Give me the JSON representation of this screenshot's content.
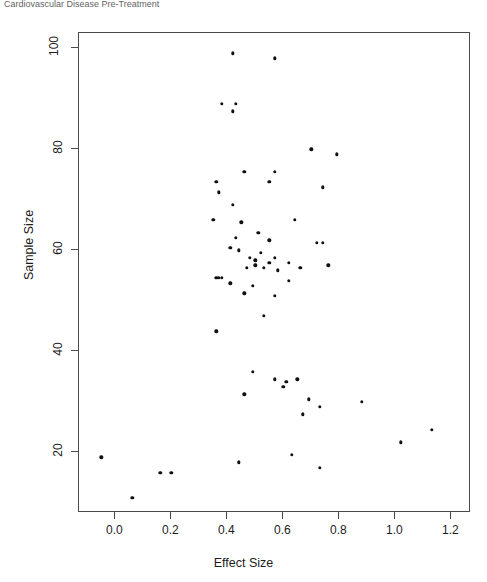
{
  "caption": {
    "text": "Cardiovascular Disease Pre-Treatment"
  },
  "chart_data": {
    "type": "scatter",
    "title": "",
    "xlabel": "Effect Size",
    "ylabel": "Sample Size",
    "xlim": [
      -0.13,
      1.27
    ],
    "ylim": [
      8,
      103
    ],
    "xticks": [
      0.0,
      0.2,
      0.4,
      0.6,
      0.8,
      1.0,
      1.2
    ],
    "xtick_labels": [
      "0.0",
      "0.2",
      "0.4",
      "0.6",
      "0.8",
      "1.0",
      "1.2"
    ],
    "yticks": [
      20,
      40,
      60,
      80,
      100
    ],
    "ytick_labels": [
      "20",
      "40",
      "60",
      "80",
      "100"
    ],
    "grid": false,
    "legend": false,
    "marker": "filled-circle",
    "marker_color": "#101010",
    "marker_size": 3.4,
    "series": [
      {
        "name": "studies",
        "points": [
          [
            0.42,
            99.0
          ],
          [
            0.57,
            98.0
          ],
          [
            0.38,
            89.0
          ],
          [
            0.43,
            89.0
          ],
          [
            0.42,
            87.5
          ],
          [
            0.7,
            80.0
          ],
          [
            0.79,
            79.0
          ],
          [
            0.46,
            75.5
          ],
          [
            0.57,
            75.5
          ],
          [
            0.36,
            73.5
          ],
          [
            0.74,
            72.5
          ],
          [
            0.55,
            73.5
          ],
          [
            0.37,
            71.5
          ],
          [
            0.42,
            69.0
          ],
          [
            0.35,
            66.0
          ],
          [
            0.45,
            65.5
          ],
          [
            0.64,
            66.0
          ],
          [
            0.51,
            63.5
          ],
          [
            0.43,
            62.5
          ],
          [
            0.55,
            62.0
          ],
          [
            0.72,
            61.5
          ],
          [
            0.74,
            61.5
          ],
          [
            0.41,
            60.5
          ],
          [
            0.44,
            60.0
          ],
          [
            0.52,
            59.5
          ],
          [
            0.48,
            58.5
          ],
          [
            0.5,
            58.0
          ],
          [
            0.5,
            57.0
          ],
          [
            0.55,
            57.5
          ],
          [
            0.57,
            58.5
          ],
          [
            0.62,
            57.5
          ],
          [
            0.47,
            56.5
          ],
          [
            0.53,
            56.5
          ],
          [
            0.58,
            56.0
          ],
          [
            0.66,
            56.5
          ],
          [
            0.76,
            57.0
          ],
          [
            0.36,
            54.5
          ],
          [
            0.37,
            54.5
          ],
          [
            0.38,
            54.5
          ],
          [
            0.41,
            53.5
          ],
          [
            0.49,
            53.0
          ],
          [
            0.62,
            54.0
          ],
          [
            0.46,
            51.5
          ],
          [
            0.57,
            51.0
          ],
          [
            0.53,
            47.0
          ],
          [
            0.36,
            44.0
          ],
          [
            0.49,
            36.0
          ],
          [
            0.57,
            34.5
          ],
          [
            0.61,
            34.0
          ],
          [
            0.65,
            34.5
          ],
          [
            0.6,
            33.0
          ],
          [
            0.46,
            31.5
          ],
          [
            0.69,
            30.5
          ],
          [
            0.88,
            30.0
          ],
          [
            0.73,
            29.0
          ],
          [
            0.67,
            27.5
          ],
          [
            1.13,
            24.5
          ],
          [
            1.02,
            22.0
          ],
          [
            0.63,
            19.5
          ],
          [
            0.73,
            17.0
          ],
          [
            0.44,
            18.0
          ],
          [
            -0.05,
            19.0
          ],
          [
            0.16,
            16.0
          ],
          [
            0.2,
            16.0
          ],
          [
            0.06,
            11.0
          ]
        ]
      }
    ]
  }
}
